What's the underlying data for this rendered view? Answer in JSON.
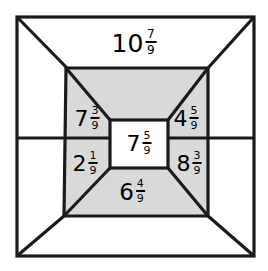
{
  "figure": {
    "type": "nested-squares-fraction-diagram",
    "background_color": "#ffffff",
    "stroke_color": "#1a1a1a",
    "shaded_color": "#d9d9d9",
    "regions": [
      {
        "id": "top",
        "name": "top-trapezoid",
        "shaded": false,
        "whole": "10",
        "numerator": "7",
        "denominator": "9",
        "value_text": "10 7/9"
      },
      {
        "id": "upper-left",
        "name": "upper-left-region",
        "shaded": true,
        "whole": "7",
        "numerator": "3",
        "denominator": "9",
        "value_text": "7 3/9"
      },
      {
        "id": "upper-right",
        "name": "upper-right-region",
        "shaded": true,
        "whole": "4",
        "numerator": "5",
        "denominator": "9",
        "value_text": "4 5/9"
      },
      {
        "id": "center",
        "name": "center-square",
        "shaded": false,
        "whole": "7",
        "numerator": "5",
        "denominator": "9",
        "value_text": "7 5/9"
      },
      {
        "id": "lower-left",
        "name": "lower-left-region",
        "shaded": true,
        "whole": "2",
        "numerator": "1",
        "denominator": "9",
        "value_text": "2 1/9"
      },
      {
        "id": "lower-right",
        "name": "lower-right-region",
        "shaded": true,
        "whole": "8",
        "numerator": "3",
        "denominator": "9",
        "value_text": "8 3/9"
      },
      {
        "id": "bottom",
        "name": "bottom-trapezoid",
        "shaded": true,
        "whole": "6",
        "numerator": "4",
        "denominator": "9",
        "value_text": "6 4/9"
      }
    ]
  }
}
